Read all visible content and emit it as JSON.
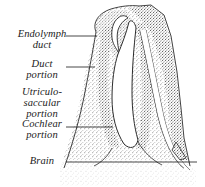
{
  "figure": {
    "type": "anatomical-line-drawing",
    "style": "stippled engraving, grayscale",
    "background_color": "#ffffff",
    "ink_color": "#1b1b1b",
    "stipple_color": "#4a4a4a",
    "width": 205,
    "height": 187
  },
  "labels": [
    {
      "id": "endolymph-duct",
      "text": "Endolymph\nduct",
      "leader_y": 36,
      "leader_x1": 66,
      "leader_x2": 96
    },
    {
      "id": "duct-portion",
      "text": "Duct\nportion",
      "leader_y": 67,
      "leader_x1": 66,
      "leader_x2": 94
    },
    {
      "id": "utriculo-saccular-portion",
      "text": "Utriculo-\nsaccular\nportion",
      "leader_y": null,
      "leader_x1": null,
      "leader_x2": null
    },
    {
      "id": "cochlear-portion",
      "text": "Cochlear\nportion",
      "leader_y": 127,
      "leader_x1": 66,
      "leader_x2": 112
    },
    {
      "id": "brain",
      "text": "Brain",
      "leader_y": 162,
      "leader_x1": 66,
      "leader_x2": 196
    }
  ]
}
